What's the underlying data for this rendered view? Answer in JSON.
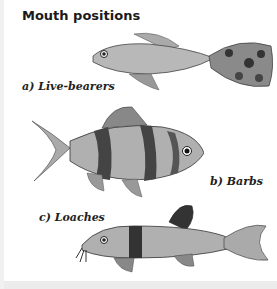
{
  "title": "Mouth positions",
  "labels": {
    "a": "a) Live-bearers",
    "b": "b) Barbs",
    "c": "c) Loaches"
  },
  "illustrations": [
    {
      "name": "live-bearer-fish",
      "description": "guppy-like fish with large spotted tail"
    },
    {
      "name": "barb-fish",
      "description": "deep-bodied barb with dark vertical bands"
    },
    {
      "name": "loach-fish",
      "description": "elongated loach with barbels and dark bands"
    }
  ],
  "colors": {
    "text": "#1a1a1a",
    "fish_light": "#b5b5b5",
    "fish_dark": "#3a3a3a"
  }
}
